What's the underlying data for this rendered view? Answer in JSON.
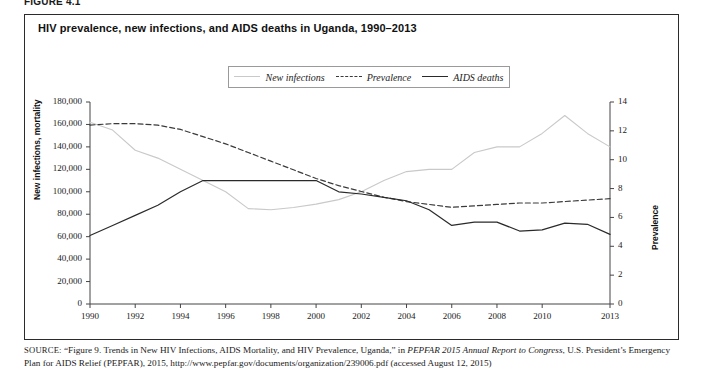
{
  "figure_tag": "FIGURE 4.1",
  "title": "HIV prevalence, new infections, and AIDS deaths in Uganda, 1990–2013",
  "legend": [
    {
      "label": "New infections",
      "style": "solid-light",
      "color": "#c9c9c9",
      "icon": "line-swatch-icon"
    },
    {
      "label": "Prevalence",
      "style": "dashed",
      "color": "#3a3a3a",
      "icon": "dashed-line-swatch-icon"
    },
    {
      "label": "AIDS deaths",
      "style": "solid-dark",
      "color": "#2a2a2a",
      "icon": "line-swatch-icon"
    }
  ],
  "source": {
    "prefix": "SOURCE:",
    "text_1": " “Figure 9. Trends in New HIV Infections, AIDS Mortality, and HIV Prevalence, Uganda,” in ",
    "italic_1": "PEPFAR 2015 Annual Report to Congress",
    "text_2": ", U.S. President’s Emergency Plan for AIDS Relief (PEPFAR), 2015, http://www.pepfar.gov/documents/organization/239006.pdf (accessed August 12, 2015)"
  },
  "chart_data": {
    "type": "line",
    "title": "HIV prevalence, new infections, and AIDS deaths in Uganda, 1990–2013",
    "xlabel": "",
    "ylabel": "New infections, mortality",
    "y2label": "Prevalence",
    "grid": false,
    "legend_position": "top-center",
    "xlim": [
      1990,
      2013
    ],
    "ylim": [
      0,
      180000
    ],
    "y2lim": [
      0,
      14
    ],
    "xticks": [
      1990,
      1992,
      1994,
      1996,
      1998,
      2000,
      2002,
      2004,
      2006,
      2008,
      2010,
      2013
    ],
    "yticks": [
      0,
      20000,
      40000,
      60000,
      80000,
      100000,
      120000,
      140000,
      160000,
      180000
    ],
    "yticklabels": [
      "0",
      "20,000",
      "40,000",
      "60,000",
      "80,000",
      "100,000",
      "120,000",
      "140,000",
      "160,000",
      "180,000"
    ],
    "y2ticks": [
      0,
      2,
      4,
      6,
      8,
      10,
      12,
      14
    ],
    "y2ticklabels": [
      "0",
      "2",
      "4",
      "6",
      "8",
      "10",
      "12",
      "14"
    ],
    "x": [
      1990,
      1991,
      1992,
      1993,
      1994,
      1995,
      1996,
      1997,
      1998,
      1999,
      2000,
      2001,
      2002,
      2003,
      2004,
      2005,
      2006,
      2007,
      2008,
      2009,
      2010,
      2011,
      2012,
      2013
    ],
    "series": [
      {
        "name": "New infections",
        "axis": "left",
        "style": "solid-light",
        "color": "#c9c9c9",
        "values": [
          162000,
          155000,
          137000,
          130000,
          120000,
          110000,
          100000,
          85000,
          84000,
          86000,
          89000,
          93000,
          100000,
          110000,
          118000,
          120000,
          120000,
          135000,
          140000,
          140000,
          152000,
          168000,
          152000,
          140000
        ]
      },
      {
        "name": "Prevalence",
        "axis": "right",
        "style": "dashed",
        "color": "#3a3a3a",
        "values": [
          12.4,
          12.5,
          12.5,
          12.4,
          12.1,
          11.6,
          11.1,
          10.5,
          9.9,
          9.3,
          8.7,
          8.2,
          7.8,
          7.4,
          7.1,
          6.9,
          6.7,
          6.8,
          6.9,
          7.0,
          7.0,
          7.1,
          7.2,
          7.3
        ]
      },
      {
        "name": "AIDS deaths",
        "axis": "left",
        "style": "solid-dark",
        "color": "#2a2a2a",
        "values": [
          61000,
          70000,
          79000,
          88000,
          100000,
          110000,
          110000,
          110000,
          110000,
          110000,
          110000,
          100000,
          98000,
          95000,
          92000,
          84000,
          70000,
          73000,
          73000,
          65000,
          66000,
          72000,
          71000,
          62000
        ]
      }
    ]
  }
}
